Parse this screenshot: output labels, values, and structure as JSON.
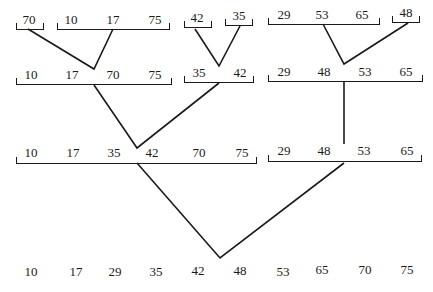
{
  "levels": [
    {
      "name": "level-0",
      "groups": [
        {
          "values": [
            "70"
          ]
        },
        {
          "values": [
            "10",
            "17",
            "75"
          ]
        },
        {
          "values": [
            "42"
          ]
        },
        {
          "values": [
            "35"
          ]
        },
        {
          "values": [
            "29",
            "53",
            "65"
          ]
        },
        {
          "values": [
            "48"
          ]
        }
      ]
    },
    {
      "name": "level-1",
      "groups": [
        {
          "values": [
            "10",
            "17",
            "70",
            "75"
          ]
        },
        {
          "values": [
            "35",
            "42"
          ]
        },
        {
          "values": [
            "29",
            "48",
            "53",
            "65"
          ]
        }
      ]
    },
    {
      "name": "level-2",
      "groups": [
        {
          "values": [
            "10",
            "17",
            "35",
            "42",
            "70",
            "75"
          ]
        },
        {
          "values": [
            "29",
            "48",
            "53",
            "65"
          ]
        }
      ]
    },
    {
      "name": "level-3",
      "groups": [
        {
          "values": [
            "10",
            "17",
            "29",
            "35",
            "42",
            "48",
            "53",
            "65",
            "70",
            "75"
          ]
        }
      ]
    }
  ],
  "colors": {
    "ink": "#1a1a1a",
    "background": "#ffffff"
  }
}
